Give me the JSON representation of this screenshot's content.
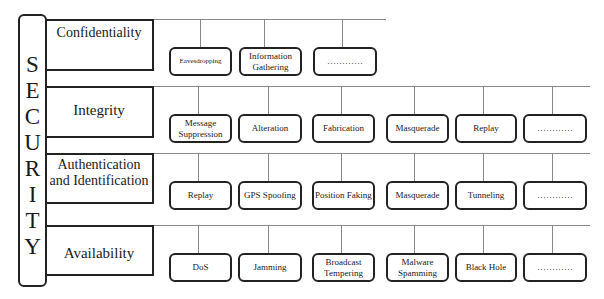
{
  "security": {
    "letters": [
      "S",
      "E",
      "C",
      "U",
      "R",
      "I",
      "T",
      "Y"
    ]
  },
  "categories": [
    {
      "label": "Confidentiality",
      "children": [
        "Eavesdropping",
        "Information Gathering",
        "…………"
      ]
    },
    {
      "label": "Integrity",
      "children": [
        "Message Suppression",
        "Alteration",
        "Fabrication",
        "Masquerade",
        "Replay",
        "…………"
      ]
    },
    {
      "label": "Authentication and Identification",
      "children": [
        "Replay",
        "GPS Spoofing",
        "Position Faking",
        "Masquerade",
        "Tunneling",
        "…………"
      ]
    },
    {
      "label": "Availability",
      "children": [
        "DoS",
        "Jamming",
        "Broadcast Tempering",
        "Malware Spamming",
        "Black Hole",
        "…………"
      ]
    }
  ]
}
